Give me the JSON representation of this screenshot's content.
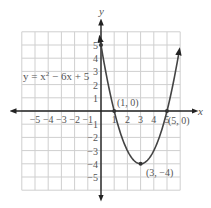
{
  "chart_data": {
    "type": "line",
    "title": "",
    "equation": "y = x² − 6x + 5",
    "xlabel": "x",
    "ylabel": "y",
    "xlim": [
      -6,
      6
    ],
    "ylim": [
      -6,
      6
    ],
    "grid": true,
    "x_ticks": [
      "−5",
      "−4",
      "−3",
      "−2",
      "−1",
      "1",
      "2",
      "3",
      "4",
      "5"
    ],
    "y_ticks": [
      "5",
      "4",
      "3",
      "2",
      "1",
      "−1",
      "−2",
      "−3",
      "−4",
      "−5"
    ],
    "series": [
      {
        "name": "y = x² − 6x + 5",
        "x_range": [
          -0.1,
          6
        ],
        "function": "x^2-6x+5"
      }
    ],
    "points": [
      {
        "x": 1,
        "y": 0,
        "label": "(1, 0)"
      },
      {
        "x": 5,
        "y": 0,
        "label": "(5, 0)"
      },
      {
        "x": 3,
        "y": -4,
        "label": "(3, −4)"
      },
      {
        "x": 0,
        "y": 5,
        "label": ""
      }
    ]
  },
  "labels": {
    "equation_text": "y = x",
    "equation_sup": "2",
    "equation_rest": " − 6x + 5",
    "x_axis": "x",
    "y_axis": "y",
    "p1": "(1, 0)",
    "p2": "(5, 0)",
    "p3": "(3, −4)"
  },
  "colors": {
    "curve": "#444444",
    "grid": "#cccccc",
    "axis": "#222222",
    "text": "#555555"
  }
}
